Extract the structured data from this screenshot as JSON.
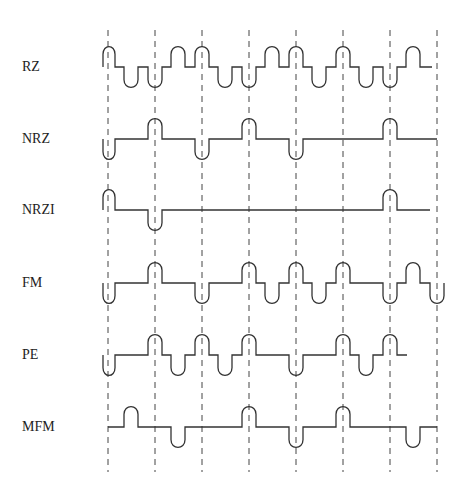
{
  "diagram": {
    "title": "",
    "colors": {
      "stroke": "#333333",
      "dash": "#444444",
      "label": "#222222",
      "background": "#ffffff"
    },
    "clock_lines_x": [
      108,
      155,
      202,
      249,
      296,
      343,
      390,
      437
    ],
    "clock_line_y_range": [
      30,
      472
    ],
    "pulse_half_width": 7,
    "pulse_height": 23,
    "rows": [
      {
        "label": "RZ",
        "baseline_y": 67,
        "start_x": 103,
        "end_x": 432,
        "pulses": [
          {
            "x": 108,
            "dir": "up"
          },
          {
            "x": 131,
            "dir": "down"
          },
          {
            "x": 155,
            "dir": "down"
          },
          {
            "x": 178,
            "dir": "up"
          },
          {
            "x": 202,
            "dir": "up"
          },
          {
            "x": 225,
            "dir": "down"
          },
          {
            "x": 249,
            "dir": "down"
          },
          {
            "x": 272,
            "dir": "up"
          },
          {
            "x": 296,
            "dir": "up"
          },
          {
            "x": 319,
            "dir": "down"
          },
          {
            "x": 343,
            "dir": "up"
          },
          {
            "x": 366,
            "dir": "down"
          },
          {
            "x": 390,
            "dir": "down"
          },
          {
            "x": 413,
            "dir": "up"
          }
        ]
      },
      {
        "label": "NRZ",
        "baseline_y": 139,
        "start_x": 103,
        "end_x": 437,
        "pulses": [
          {
            "x": 108,
            "dir": "down"
          },
          {
            "x": 155,
            "dir": "up"
          },
          {
            "x": 202,
            "dir": "down"
          },
          {
            "x": 249,
            "dir": "up"
          },
          {
            "x": 296,
            "dir": "down"
          },
          {
            "x": 390,
            "dir": "up"
          }
        ]
      },
      {
        "label": "NRZI",
        "baseline_y": 210,
        "start_x": 103,
        "end_x": 430,
        "pulses": [
          {
            "x": 108,
            "dir": "up"
          },
          {
            "x": 155,
            "dir": "down"
          },
          {
            "x": 390,
            "dir": "up"
          }
        ]
      },
      {
        "label": "FM",
        "baseline_y": 283,
        "start_x": 103,
        "end_x": 440,
        "pulses": [
          {
            "x": 108,
            "dir": "down"
          },
          {
            "x": 155,
            "dir": "up"
          },
          {
            "x": 202,
            "dir": "down"
          },
          {
            "x": 249,
            "dir": "up"
          },
          {
            "x": 272,
            "dir": "down"
          },
          {
            "x": 296,
            "dir": "up"
          },
          {
            "x": 319,
            "dir": "down"
          },
          {
            "x": 343,
            "dir": "up"
          },
          {
            "x": 390,
            "dir": "down"
          },
          {
            "x": 413,
            "dir": "up"
          },
          {
            "x": 437,
            "dir": "down"
          }
        ]
      },
      {
        "label": "PE",
        "baseline_y": 355,
        "start_x": 103,
        "end_x": 407,
        "pulses": [
          {
            "x": 108,
            "dir": "down"
          },
          {
            "x": 155,
            "dir": "up"
          },
          {
            "x": 178,
            "dir": "down"
          },
          {
            "x": 202,
            "dir": "up"
          },
          {
            "x": 225,
            "dir": "down"
          },
          {
            "x": 249,
            "dir": "up"
          },
          {
            "x": 296,
            "dir": "down"
          },
          {
            "x": 343,
            "dir": "up"
          },
          {
            "x": 366,
            "dir": "down"
          },
          {
            "x": 390,
            "dir": "up"
          }
        ]
      },
      {
        "label": "MFM",
        "baseline_y": 427,
        "start_x": 108,
        "end_x": 437,
        "pulses": [
          {
            "x": 131,
            "dir": "up"
          },
          {
            "x": 178,
            "dir": "down"
          },
          {
            "x": 249,
            "dir": "up"
          },
          {
            "x": 296,
            "dir": "down"
          },
          {
            "x": 343,
            "dir": "up"
          },
          {
            "x": 413,
            "dir": "down"
          }
        ]
      }
    ]
  }
}
